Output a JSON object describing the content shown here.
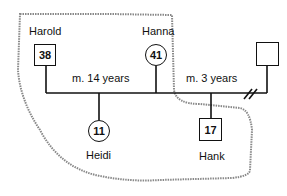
{
  "diagram": {
    "type": "genogram",
    "people": [
      {
        "id": "harold",
        "name": "Harold",
        "age": "38",
        "shape": "square"
      },
      {
        "id": "hanna",
        "name": "Hanna",
        "age": "41",
        "shape": "circle"
      },
      {
        "id": "heidi",
        "name": "Heidi",
        "age": "11",
        "shape": "circle"
      },
      {
        "id": "hank",
        "name": "Hank",
        "age": "17",
        "shape": "square"
      },
      {
        "id": "unknown",
        "name": "",
        "age": "",
        "shape": "square"
      }
    ],
    "relationships": [
      {
        "label": "m. 14 years",
        "between": [
          "harold",
          "hanna"
        ]
      },
      {
        "label": "m. 3 years",
        "between": [
          "hanna",
          "unknown"
        ],
        "status": "divorced"
      }
    ],
    "colors": {
      "line": "#111111",
      "boundary": "#888888"
    }
  }
}
